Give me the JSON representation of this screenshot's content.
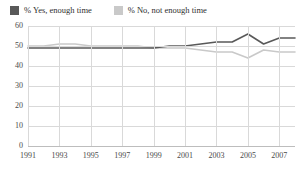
{
  "legend": {
    "position": "top-left",
    "entries": [
      {
        "label": "% Yes, enough time",
        "color": "#595959",
        "swatch": "legend-swatch-yes"
      },
      {
        "label": "% No, not enough time",
        "color": "#c9c9c9",
        "swatch": "legend-swatch-no"
      }
    ]
  },
  "chart_data": {
    "type": "line",
    "title": "",
    "subtitle": "",
    "xlabel": "",
    "ylabel": "",
    "grid": true,
    "legend_position": "top-left",
    "x": [
      1991,
      1992,
      1993,
      1994,
      1995,
      1996,
      1997,
      1998,
      1999,
      2000,
      2001,
      2002,
      2003,
      2004,
      2005,
      2006,
      2007,
      2008
    ],
    "xlim": [
      1991,
      2008
    ],
    "ylim": [
      0,
      60
    ],
    "yticks": [
      0,
      10,
      20,
      30,
      40,
      50,
      60
    ],
    "xticks": [
      1991,
      1993,
      1995,
      1997,
      1999,
      2001,
      2003,
      2005,
      2007
    ],
    "ytick_labels": [
      "0",
      "10",
      "20",
      "30",
      "40",
      "50",
      "60"
    ],
    "xtick_labels": [
      "1991",
      "1993",
      "1995",
      "1997",
      "1999",
      "2001",
      "2003",
      "2005",
      "2007"
    ],
    "series": [
      {
        "name": "% Yes, enough time",
        "color": "#595959",
        "values": [
          49,
          49,
          49,
          49,
          49,
          49,
          49,
          49,
          49,
          50,
          50,
          51,
          52,
          52,
          56,
          51,
          54,
          54
        ]
      },
      {
        "name": "% No, not enough time",
        "color": "#c9c9c9",
        "values": [
          50,
          50,
          51,
          51,
          50,
          50,
          50,
          50,
          49,
          49,
          49,
          48,
          47,
          47,
          44,
          48,
          47,
          47
        ]
      }
    ]
  }
}
